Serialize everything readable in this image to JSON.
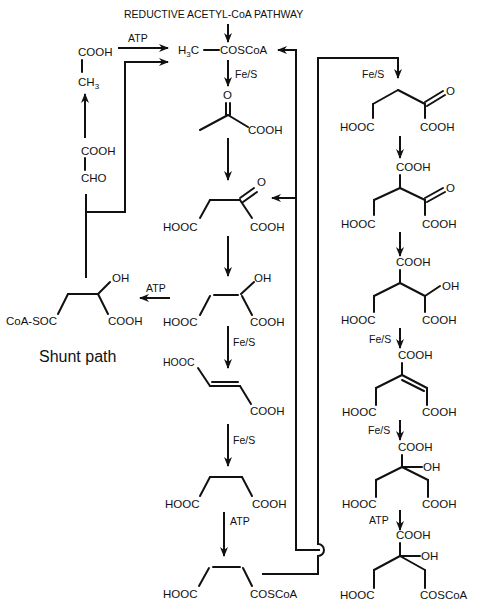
{
  "title": "REDUCTIVE ACETYL-CoA PATHWAY",
  "shunt_label": "Shunt path",
  "catalysts": {
    "atp": "ATP",
    "fes": "Fe/S"
  },
  "groups": {
    "cooh": "COOH",
    "hooc": "HOOC",
    "oh": "OH",
    "o": "O",
    "cho": "CHO",
    "ch3": "CH",
    "ch3_sub": "3",
    "h3c_h": "H",
    "h3c_sub": "3",
    "h3c_c": "C",
    "coscoa": "COSCoA",
    "coa_soc": "CoA-SOC"
  },
  "center_column": [
    {
      "name": "acetyl-CoA",
      "label": "H3C-COSCoA"
    },
    {
      "name": "pyruvate",
      "groups": [
        "O",
        "COOH"
      ]
    },
    {
      "name": "oxaloacetate",
      "groups": [
        "O",
        "HOOC",
        "COOH"
      ]
    },
    {
      "name": "malate",
      "groups": [
        "OH",
        "HOOC",
        "COOH"
      ]
    },
    {
      "name": "fumarate",
      "groups": [
        "HOOC",
        "COOH"
      ]
    },
    {
      "name": "succinate",
      "groups": [
        "HOOC",
        "COOH"
      ]
    },
    {
      "name": "succinyl-CoA",
      "groups": [
        "HOOC",
        "COSCoA"
      ]
    }
  ],
  "right_column": [
    {
      "name": "2-oxoglutarate",
      "groups": [
        "O",
        "HOOC",
        "COOH"
      ]
    },
    {
      "name": "oxalosuccinate",
      "groups": [
        "COOH",
        "O",
        "HOOC",
        "COOH"
      ]
    },
    {
      "name": "isocitrate",
      "groups": [
        "COOH",
        "OH",
        "HOOC",
        "COOH"
      ]
    },
    {
      "name": "aconitate",
      "groups": [
        "COOH",
        "HOOC",
        "COOH"
      ]
    },
    {
      "name": "citrate",
      "groups": [
        "COOH",
        "OH",
        "HOOC",
        "COOH"
      ]
    },
    {
      "name": "citryl-CoA",
      "groups": [
        "COOH",
        "OH",
        "HOOC",
        "COSCoA"
      ]
    }
  ],
  "shunt_column": [
    {
      "name": "acetate",
      "groups": [
        "COOH",
        "CH3"
      ]
    },
    {
      "name": "glyoxylate",
      "groups": [
        "COOH",
        "CHO"
      ]
    },
    {
      "name": "malyl-CoA",
      "groups": [
        "OH",
        "CoA-SOC",
        "COOH"
      ]
    }
  ]
}
